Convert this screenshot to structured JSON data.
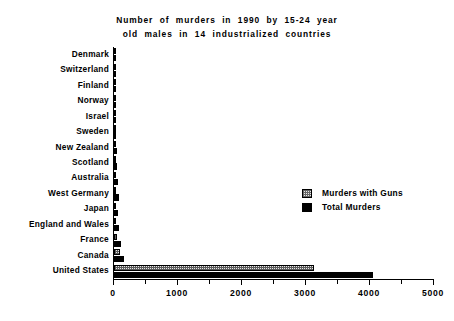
{
  "chart_data": {
    "type": "bar",
    "orientation": "horizontal",
    "title": "Number of murders in 1990 by 15-24 year old males in 14 industrialized countries",
    "title_lines": [
      "Number  of  murders  in  1990  by  15-24  year",
      "old  males  in  14  industrialized  countries"
    ],
    "xlabel": "",
    "ylabel": "",
    "xlim": [
      0,
      5000
    ],
    "xticks": [
      0,
      1000,
      2000,
      3000,
      4000,
      5000
    ],
    "xtick_labels": [
      "0",
      "1000",
      "2000",
      "3000",
      "4000",
      "5000"
    ],
    "minor_tick_step": 500,
    "grid": false,
    "legend_position": "center-right",
    "categories": [
      "Denmark",
      "Switzerland",
      "Finland",
      "Norway",
      "Israel",
      "Sweden",
      "New Zealand",
      "Scotland",
      "Australia",
      "West Germany",
      "Japan",
      "England and Wales",
      "France",
      "Canada",
      "United States"
    ],
    "series": [
      {
        "name": "Murders with Guns",
        "style": "hatched",
        "values": [
          2,
          4,
          5,
          6,
          8,
          8,
          12,
          12,
          18,
          28,
          12,
          14,
          40,
          95,
          3125
        ]
      },
      {
        "name": "Total Murders",
        "style": "solid-black",
        "values": [
          10,
          18,
          22,
          24,
          28,
          30,
          42,
          48,
          60,
          85,
          70,
          78,
          110,
          155,
          4050
        ]
      }
    ]
  },
  "legend": {
    "items": [
      {
        "label": "Murders with Guns",
        "swatch": "hatched-square",
        "color": "#eaeaea"
      },
      {
        "label": "Total Murders",
        "swatch": "solid-square",
        "color": "#000000"
      }
    ]
  }
}
